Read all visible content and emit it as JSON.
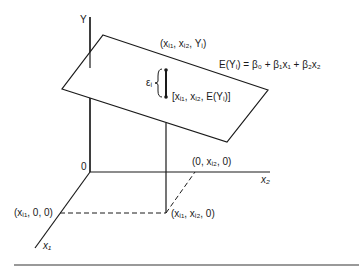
{
  "diagram": {
    "type": "3d-regression-plane",
    "axes": {
      "y_label": "Y",
      "x1_label": "x₁",
      "x2_label": "x₂",
      "origin_label": "0"
    },
    "equation": "E(Yᵢ) = β₀ + β₁x₁ + β₂x₂",
    "points": {
      "observed": "(xᵢ₁, xᵢ₂, Yᵢ)",
      "expected": "[xᵢ₁, xᵢ₂, E(Yᵢ)]",
      "x1_projection": "(xᵢ₁, 0, 0)",
      "x2_projection": "(0, xᵢ₂, 0)",
      "base_projection": "(xᵢ₁, xᵢ₂, 0)"
    },
    "error_label": "εᵢ",
    "colors": {
      "ink": "#1a1a1a",
      "rule": "#777777"
    }
  }
}
